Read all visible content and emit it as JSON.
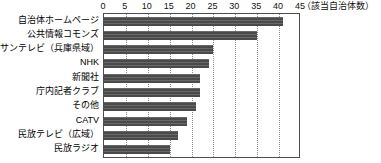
{
  "chart_data": {
    "type": "bar",
    "orientation": "horizontal",
    "title": "",
    "xlabel": "",
    "ylabel": "",
    "unit_note": "（該当自治体数）",
    "xlim": [
      0,
      45
    ],
    "xticks": [
      0,
      5,
      10,
      15,
      20,
      25,
      30,
      35,
      40,
      45
    ],
    "xtick_labels": [
      "0",
      "5",
      "10",
      "15",
      "20",
      "25",
      "30",
      "35",
      "40",
      "45"
    ],
    "grid": "vertical-dotted",
    "legend": "none",
    "bar_color": "#4a4a4a",
    "categories": [
      "自治体ホームページ",
      "公共情報コモンズ",
      "サンテレビ（兵庫県域）",
      "NHK",
      "新聞社",
      "庁内記者クラブ",
      "その他",
      "CATV",
      "民放テレビ（広域）",
      "民放ラジオ"
    ],
    "values": [
      41,
      35,
      25,
      24,
      22,
      22,
      21,
      19,
      17,
      15
    ]
  }
}
